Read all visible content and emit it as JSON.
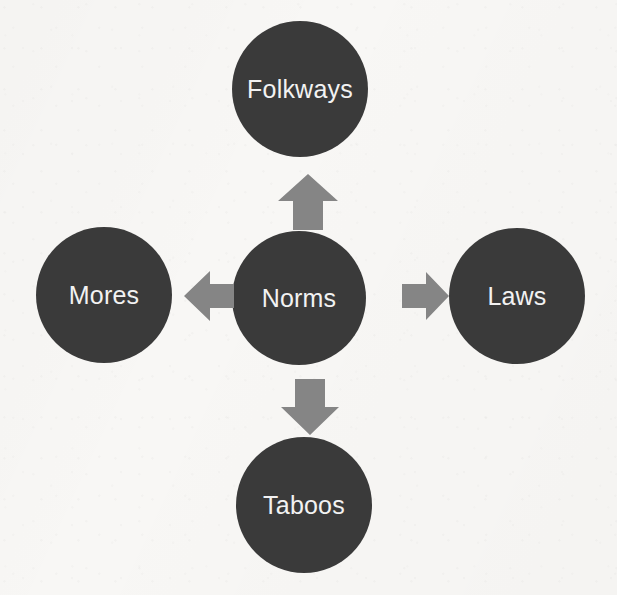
{
  "diagram": {
    "type": "radial-hub-and-spoke",
    "title": "",
    "background_color": "#f8f7f5",
    "node_color": "#3a3a3a",
    "node_text_color": "#f2f2f2",
    "arrow_color": "#858585",
    "center": {
      "id": "norms",
      "label": "Norms"
    },
    "nodes": [
      {
        "id": "folkways",
        "label": "Folkways",
        "position": "top"
      },
      {
        "id": "mores",
        "label": "Mores",
        "position": "left"
      },
      {
        "id": "norms",
        "label": "Norms",
        "position": "center"
      },
      {
        "id": "laws",
        "label": "Laws",
        "position": "right"
      },
      {
        "id": "taboos",
        "label": "Taboos",
        "position": "bottom"
      }
    ],
    "arrows": [
      {
        "id": "arrow-up",
        "icon": "arrow-up-icon",
        "from": "norms",
        "to": "folkways",
        "direction": "up"
      },
      {
        "id": "arrow-right",
        "icon": "arrow-right-icon",
        "from": "norms",
        "to": "laws",
        "direction": "right"
      },
      {
        "id": "arrow-down",
        "icon": "arrow-down-icon",
        "from": "norms",
        "to": "taboos",
        "direction": "down"
      },
      {
        "id": "arrow-left",
        "icon": "arrow-left-icon",
        "from": "norms",
        "to": "mores",
        "direction": "left"
      }
    ]
  }
}
